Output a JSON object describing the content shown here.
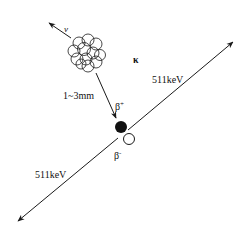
{
  "diagram": {
    "colors": {
      "line": "#1a1a1a",
      "background": "#ffffff"
    },
    "labels": {
      "neutrino": "ν",
      "range": "1~3mm",
      "positron_base": "β",
      "positron_sup": "+",
      "electron_base": "β",
      "electron_sup": "-",
      "kappa": "κ",
      "gamma_upper": "511keV",
      "gamma_lower": "511keV"
    }
  }
}
